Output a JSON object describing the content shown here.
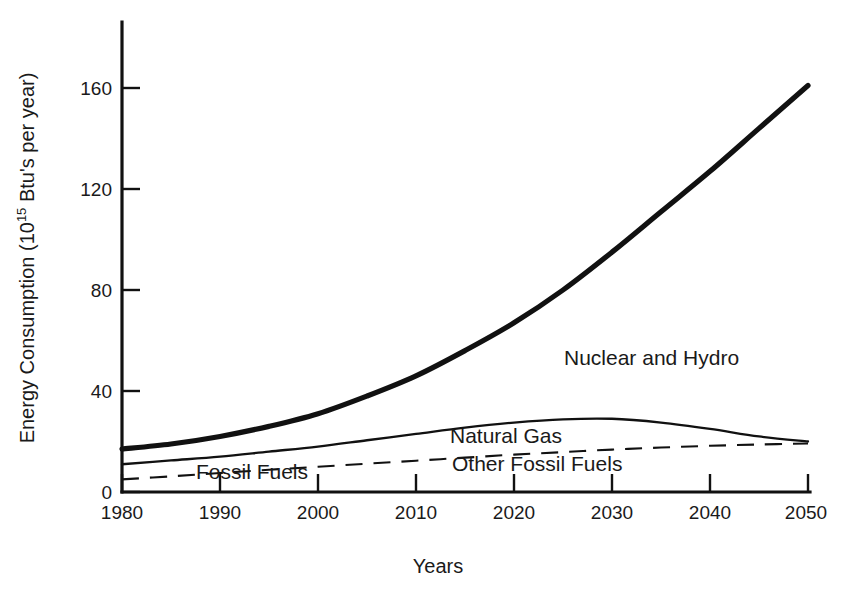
{
  "chart_data": {
    "type": "line",
    "title": "",
    "xlabel": "Years",
    "ylabel": "Energy Consumption (10^15 Btu's per year)",
    "ylabel_parts": {
      "pre": "Energy Consumption (10",
      "sup": "15",
      "post": " Btu's per year)"
    },
    "xlim": [
      1980,
      2050
    ],
    "ylim": [
      0,
      180
    ],
    "xticks": [
      1980,
      1990,
      2000,
      2010,
      2020,
      2030,
      2040,
      2050
    ],
    "yticks": [
      0,
      40,
      80,
      120,
      160
    ],
    "xtick_labels": [
      "1980",
      "1990",
      "2000",
      "2010",
      "2020",
      "2030",
      "2040",
      "2050"
    ],
    "ytick_labels": [
      "0",
      "40",
      "80",
      "120",
      "160"
    ],
    "grid": false,
    "legend": "inline-annotations",
    "x": [
      1980,
      1985,
      1990,
      1995,
      2000,
      2005,
      2010,
      2015,
      2020,
      2025,
      2030,
      2035,
      2040,
      2045,
      2050
    ],
    "series": [
      {
        "name": "Nuclear and Hydro",
        "style": "thick-solid",
        "label_x": 2035,
        "label_y": 57,
        "values": [
          17,
          19,
          22,
          26,
          31,
          38,
          46,
          56,
          67,
          80,
          95,
          111,
          127,
          144,
          161
        ]
      },
      {
        "name": "Natural Gas",
        "style": "thin-solid",
        "label_x": 2027,
        "label_y": 24,
        "values": [
          11,
          12.5,
          14,
          16,
          18,
          20.5,
          23,
          25.5,
          27.5,
          28.8,
          29,
          27.5,
          25,
          22,
          20
        ]
      },
      {
        "name": "Other Fossil Fuels",
        "style": "dashed",
        "label_x": 2029,
        "label_y": 13,
        "values": [
          5,
          6.2,
          7.5,
          8.8,
          10,
          11.2,
          12.4,
          13.6,
          14.8,
          15.8,
          16.8,
          17.6,
          18.3,
          18.8,
          19.2
        ]
      }
    ],
    "annotations": [
      {
        "text": "Nuclear and Hydro",
        "x": 2031,
        "y": 58
      },
      {
        "text": "Natural Gas",
        "x": 2025,
        "y": 25
      },
      {
        "text": "Other Fossil Fuels",
        "x": 2026,
        "y": 13
      },
      {
        "text": "Fossil Fuels",
        "x": 1991,
        "y": 8
      }
    ],
    "colors": {
      "line": "#111111",
      "background": "#ffffff",
      "text": "#1a1a1a"
    }
  },
  "axis": {
    "x_title": "Years",
    "y_title_pre": "Energy Consumption (10",
    "y_title_sup": "15",
    "y_title_post": " Btu's per year)"
  },
  "ticks": {
    "y": [
      "160",
      "120",
      "80",
      "40",
      "0"
    ],
    "x": [
      "1980",
      "1990",
      "2000",
      "2010",
      "2020",
      "2030",
      "2040",
      "2050"
    ]
  },
  "labels": {
    "nuclear": "Nuclear and Hydro",
    "natural_gas": "Natural Gas",
    "other_fossil": "Other Fossil Fuels",
    "fossil_fuels": "Fossil Fuels"
  }
}
